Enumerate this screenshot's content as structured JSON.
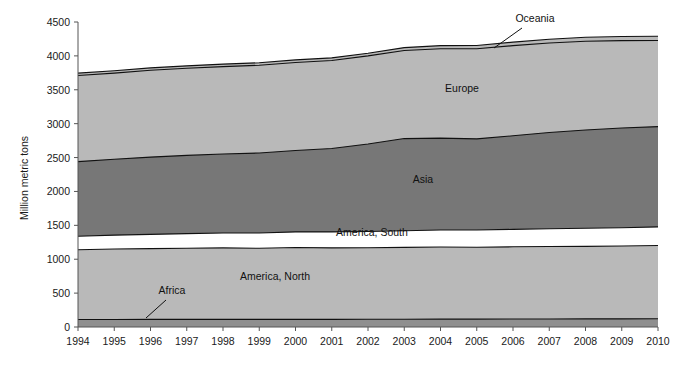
{
  "chart_data": {
    "type": "area",
    "stacked": true,
    "title": "",
    "subtitle": "",
    "xlabel": "",
    "ylabel": "Million metric tons",
    "grid": false,
    "legend_position": "inline-annotations",
    "x": [
      1994,
      1995,
      1996,
      1997,
      1998,
      1999,
      2000,
      2001,
      2002,
      2003,
      2004,
      2005,
      2006,
      2007,
      2008,
      2009,
      2010
    ],
    "categories": [
      "1994",
      "1995",
      "1996",
      "1997",
      "1998",
      "1999",
      "2000",
      "2001",
      "2002",
      "2003",
      "2004",
      "2005",
      "2006",
      "2007",
      "2008",
      "2009",
      "2010"
    ],
    "xlim": [
      1994,
      2010
    ],
    "ylim": [
      0,
      4500
    ],
    "yticks": [
      0,
      500,
      1000,
      1500,
      2000,
      2500,
      3000,
      3500,
      4000,
      4500
    ],
    "ytick_labels": [
      "0",
      "500",
      "1000",
      "1500",
      "2000",
      "2500",
      "3000",
      "3500",
      "4000",
      "4500"
    ],
    "series": [
      {
        "name": "Africa",
        "color": "#8f8f8f",
        "values": [
          110,
          110,
          112,
          112,
          112,
          112,
          113,
          113,
          115,
          115,
          116,
          116,
          118,
          118,
          120,
          120,
          122
        ]
      },
      {
        "name": "America, North",
        "color": "#b9b9b9",
        "values": [
          1030,
          1040,
          1045,
          1050,
          1055,
          1050,
          1060,
          1055,
          1055,
          1060,
          1065,
          1060,
          1065,
          1070,
          1070,
          1075,
          1080
        ]
      },
      {
        "name": "America, South",
        "color": "#ffffff",
        "values": [
          200,
          205,
          210,
          215,
          220,
          225,
          230,
          235,
          240,
          245,
          250,
          255,
          258,
          262,
          266,
          270,
          275
        ]
      },
      {
        "name": "Asia",
        "color": "#777777",
        "values": [
          1100,
          1120,
          1140,
          1155,
          1165,
          1180,
          1200,
          1230,
          1290,
          1360,
          1355,
          1345,
          1380,
          1420,
          1450,
          1470,
          1480
        ]
      },
      {
        "name": "Europe",
        "color": "#b9b9b9",
        "values": [
          1270,
          1270,
          1280,
          1285,
          1290,
          1295,
          1300,
          1300,
          1300,
          1300,
          1320,
          1330,
          1330,
          1320,
          1310,
          1290,
          1270
        ]
      },
      {
        "name": "Oceania",
        "color": "#b9b9b9",
        "values": [
          35,
          35,
          36,
          36,
          37,
          37,
          38,
          38,
          40,
          42,
          45,
          48,
          52,
          56,
          58,
          60,
          62
        ]
      }
    ],
    "stack_tops": {
      "Africa": [
        110,
        110,
        112,
        112,
        112,
        112,
        113,
        113,
        115,
        115,
        116,
        116,
        118,
        118,
        120,
        120,
        122
      ],
      "America, North": [
        1140,
        1150,
        1157,
        1162,
        1167,
        1162,
        1173,
        1168,
        1170,
        1175,
        1181,
        1176,
        1183,
        1188,
        1190,
        1195,
        1202
      ],
      "America, South": [
        1340,
        1355,
        1367,
        1377,
        1387,
        1387,
        1403,
        1403,
        1410,
        1420,
        1431,
        1431,
        1441,
        1450,
        1456,
        1465,
        1477
      ],
      "Asia": [
        2440,
        2475,
        2507,
        2532,
        2552,
        2567,
        2603,
        2633,
        2700,
        2780,
        2786,
        2776,
        2821,
        2870,
        2906,
        2935,
        2957
      ],
      "Europe": [
        3710,
        3745,
        3787,
        3817,
        3842,
        3862,
        3903,
        3933,
        4000,
        4080,
        4106,
        4106,
        4151,
        4190,
        4216,
        4225,
        4227
      ],
      "Oceania": [
        3745,
        3780,
        3823,
        3853,
        3879,
        3899,
        3941,
        3971,
        4040,
        4122,
        4151,
        4154,
        4203,
        4246,
        4274,
        4285,
        4289
      ]
    },
    "annotations": [
      {
        "label": "Oceania",
        "x": 535,
        "y": 22,
        "leader": true
      },
      {
        "label": "Europe",
        "x": 462,
        "y": 92,
        "leader": false
      },
      {
        "label": "Asia",
        "x": 423,
        "y": 183,
        "leader": false
      },
      {
        "label": "America, South",
        "x": 372,
        "y": 236,
        "leader": false
      },
      {
        "label": "America, North",
        "x": 275,
        "y": 280,
        "leader": false
      },
      {
        "label": "Africa",
        "x": 172,
        "y": 294,
        "leader": true
      }
    ]
  }
}
